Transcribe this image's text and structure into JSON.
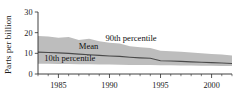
{
  "chart_data": {
    "type": "area",
    "title": "",
    "subtitle": "",
    "xlabel": "",
    "ylabel": "Parts per billion",
    "xlim": [
      1983,
      2002
    ],
    "ylim": [
      0,
      30
    ],
    "grid": false,
    "legend_position": "inline-annotations",
    "y_ticks": [
      0,
      10,
      20,
      30
    ],
    "y_tick_labels": [
      "0",
      "10",
      "20",
      "30"
    ],
    "x_ticks": [
      1985,
      1990,
      1995,
      2000
    ],
    "x_tick_labels": [
      "1985",
      "1990",
      "1995",
      "2000"
    ],
    "x_minor_ticks": [
      1983,
      1984,
      1986,
      1987,
      1988,
      1989,
      1991,
      1992,
      1993,
      1994,
      1996,
      1997,
      1998,
      1999,
      2001,
      2002
    ],
    "annotations": [
      {
        "name": "90th-percentile-label",
        "text": "90th percentile",
        "x": 1989.6,
        "y": 16.2
      },
      {
        "name": "mean-label",
        "text": "Mean",
        "x": 1987.0,
        "y": 11.9
      },
      {
        "name": "10th-percentile-label",
        "text": "10th percentile",
        "x": 1983.6,
        "y": 6.3
      }
    ],
    "x": [
      1983,
      1984,
      1985,
      1986,
      1987,
      1988,
      1989,
      1990,
      1991,
      1992,
      1993,
      1994,
      1995,
      1996,
      1997,
      1998,
      1999,
      2000,
      2001,
      2002
    ],
    "series": [
      {
        "name": "90th percentile",
        "values": [
          18.4,
          18.2,
          17.6,
          17.9,
          16.4,
          17.0,
          15.9,
          15.1,
          14.7,
          13.4,
          13.0,
          12.6,
          11.2,
          11.0,
          10.8,
          10.4,
          10.0,
          9.7,
          9.4,
          9.0
        ]
      },
      {
        "name": "Mean",
        "values": [
          10.6,
          10.4,
          10.2,
          10.0,
          9.6,
          9.3,
          9.0,
          8.7,
          8.5,
          8.1,
          7.8,
          7.6,
          6.4,
          6.3,
          6.1,
          5.9,
          5.7,
          5.5,
          5.3,
          5.1
        ]
      },
      {
        "name": "10th percentile",
        "values": [
          4.9,
          4.9,
          4.8,
          4.8,
          4.7,
          4.7,
          4.6,
          4.6,
          4.5,
          4.4,
          4.4,
          4.3,
          4.2,
          4.2,
          4.1,
          4.1,
          4.0,
          4.0,
          3.9,
          3.9
        ]
      }
    ],
    "colors": {
      "band_fill": "#bdbdbd",
      "mean_line": "#4a4a4a",
      "axis": "#2b2b2b",
      "text": "#1a1a1a",
      "background": "#ffffff"
    }
  }
}
